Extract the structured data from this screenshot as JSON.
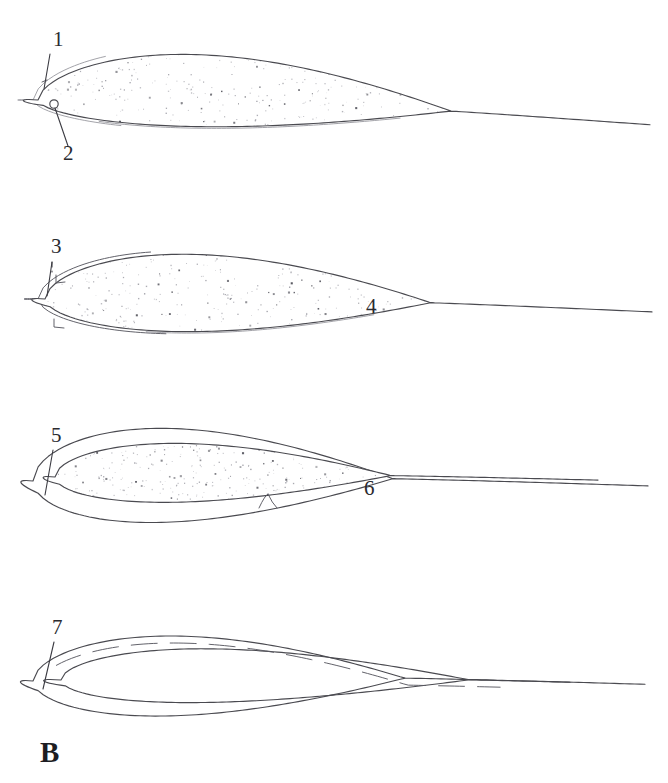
{
  "figure": {
    "panel_letter": "B",
    "caption_letter_position": {
      "x": 40,
      "y": 762
    },
    "background_color": "#ffffff",
    "ink_color": "#4a4a50",
    "stipple_color": "#9a9aa2",
    "label_color": "#2a2a2f",
    "canvas": {
      "width": 668,
      "height": 783
    }
  },
  "callouts": [
    {
      "id": "callout-1",
      "label": "1",
      "text_x": 53,
      "text_y": 46,
      "leader": {
        "x1": 50,
        "y1": 54,
        "x2": 44,
        "y2": 89
      },
      "target": "outer-rim-leading-edge-specimen-1"
    },
    {
      "id": "callout-2",
      "label": "2",
      "text_x": 63,
      "text_y": 160,
      "leader": {
        "x1": 68,
        "y1": 146,
        "x2": 55,
        "y2": 108
      },
      "target": "small-circular-structure-specimen-1"
    },
    {
      "id": "callout-3",
      "label": "3",
      "text_x": 51,
      "text_y": 253,
      "leader": {
        "x1": 52,
        "y1": 262,
        "x2": 47,
        "y2": 296
      },
      "target": "outer-rim-leading-edge-specimen-2",
      "dashed_segment": {
        "x1": 52,
        "y1": 262,
        "x2": 52,
        "y2": 272
      }
    },
    {
      "id": "callout-4",
      "label": "4",
      "text_x": 366,
      "text_y": 313,
      "leader": null,
      "target": "stippled-body-specimen-2"
    },
    {
      "id": "callout-5",
      "label": "5",
      "text_x": 51,
      "text_y": 442,
      "leader": {
        "x1": 53,
        "y1": 450,
        "x2": 45,
        "y2": 495
      },
      "target": "outer-envelope-leading-edge-specimen-3"
    },
    {
      "id": "callout-6",
      "label": "6",
      "text_x": 364,
      "text_y": 495,
      "leader": null,
      "target": "stippled-body-specimen-3"
    },
    {
      "id": "callout-7",
      "label": "7",
      "text_x": 52,
      "text_y": 634,
      "leader": {
        "x1": 54,
        "y1": 642,
        "x2": 43,
        "y2": 689
      },
      "target": "outer-envelope-leading-edge-specimen-4"
    }
  ],
  "specimens": [
    {
      "id": "specimen-1",
      "name": "airfoil-section-solid-stippled",
      "order": 1,
      "bounds": {
        "x_left": 38,
        "x_right": 650,
        "y_top": 55,
        "y_bottom": 145
      },
      "has_stipple": true,
      "has_outer_rim": true,
      "has_inner_loop": false,
      "has_small_circle": true,
      "small_circle": {
        "cx": 54,
        "cy": 104,
        "r": 4.2
      },
      "stipple_seed": 11,
      "stipple_count": 980
    },
    {
      "id": "specimen-2",
      "name": "airfoil-section-rimmed-stippled",
      "order": 2,
      "bounds": {
        "x_left": 38,
        "x_right": 652,
        "y_top": 253,
        "y_bottom": 345
      },
      "has_stipple": true,
      "has_outer_rim": true,
      "has_inner_loop": false,
      "has_small_circle": false,
      "has_step_notches": true,
      "stipple_seed": 27,
      "stipple_count": 1020
    },
    {
      "id": "specimen-3",
      "name": "airfoil-section-enveloped-stippled",
      "order": 3,
      "bounds": {
        "x_left": 33,
        "x_right": 648,
        "y_top": 432,
        "y_bottom": 530
      },
      "has_stipple": true,
      "has_outer_rim": true,
      "has_inner_loop": true,
      "has_small_circle": false,
      "has_center_notch": true,
      "center_notch": {
        "x": 268,
        "y": 508
      },
      "stipple_seed": 43,
      "stipple_count": 900
    },
    {
      "id": "specimen-4",
      "name": "airfoil-section-outline-only",
      "order": 4,
      "bounds": {
        "x_left": 33,
        "x_right": 645,
        "y_top": 640,
        "y_bottom": 722
      },
      "has_stipple": false,
      "has_outer_rim": true,
      "has_inner_loop": true,
      "has_small_circle": false,
      "has_dashed_upper": true,
      "stipple_seed": 0,
      "stipple_count": 0
    }
  ]
}
